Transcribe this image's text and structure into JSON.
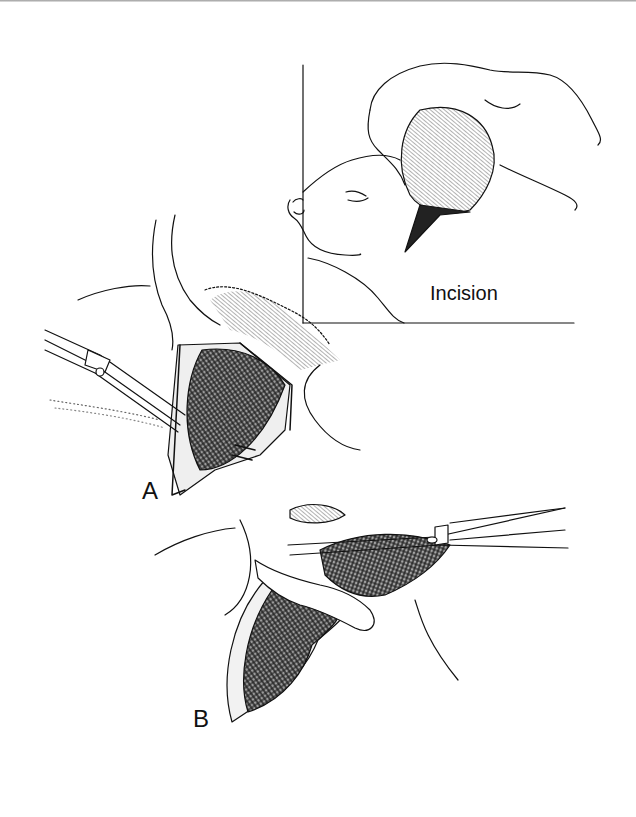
{
  "figure": {
    "inset": {
      "label": "Incision"
    },
    "panels": [
      {
        "id": "A",
        "label": "A"
      },
      {
        "id": "B",
        "label": "B"
      }
    ]
  },
  "colors": {
    "ink": "#111111",
    "tissue_shade": "#8a8a8a",
    "background": "#ffffff"
  }
}
